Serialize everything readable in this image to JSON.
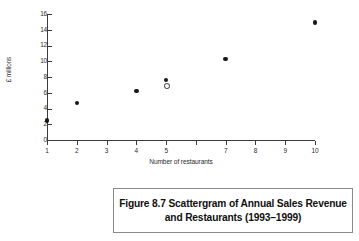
{
  "figure": {
    "caption_line1": "Figure 8.7 Scattergram of Annual Sales Revenue",
    "caption_line2": "and Restaurants (1993–1999)"
  },
  "axes": {
    "y_title": "£ millions",
    "x_title": "Number of restaurants",
    "y_ticks": [
      "0",
      "2",
      "4",
      "6",
      "8",
      "10",
      "12",
      "14",
      "16"
    ],
    "x_ticks": [
      "1",
      "2",
      "3",
      "4",
      "5",
      "",
      "7",
      "8",
      "9",
      "10"
    ]
  },
  "colors": {
    "marker": "#181818",
    "axis": "#3a3a3a",
    "caption_border": "#8a8a8a",
    "background": "#ffffff"
  },
  "chart_data": {
    "type": "scatter",
    "title": "Figure 8.7 Scattergram of Annual Sales Revenue and Restaurants (1993–1999)",
    "xlabel": "Number of restaurants",
    "ylabel": "£ millions",
    "xlim": [
      1,
      10
    ],
    "ylim": [
      0,
      16
    ],
    "ytick_values": [
      0,
      2,
      4,
      6,
      8,
      10,
      12,
      14,
      16
    ],
    "xtick_values": [
      1,
      2,
      3,
      4,
      5,
      6,
      7,
      8,
      9,
      10
    ],
    "xtick_labels": [
      "1",
      "2",
      "3",
      "4",
      "5",
      "",
      "7",
      "8",
      "9",
      "10"
    ],
    "grid": false,
    "legend": null,
    "series": [
      {
        "name": "Annual sales revenue",
        "marker": "filled-circle",
        "points": [
          {
            "x": 1,
            "y": 2.5
          },
          {
            "x": 2,
            "y": 4.7
          },
          {
            "x": 4,
            "y": 6.25
          },
          {
            "x": 5,
            "y": 7.6
          },
          {
            "x": 7,
            "y": 10.3
          },
          {
            "x": 10,
            "y": 14.9
          }
        ]
      },
      {
        "name": "Outlier / second observation",
        "marker": "open-circle",
        "points": [
          {
            "x": 5,
            "y": 6.9
          }
        ]
      }
    ]
  }
}
